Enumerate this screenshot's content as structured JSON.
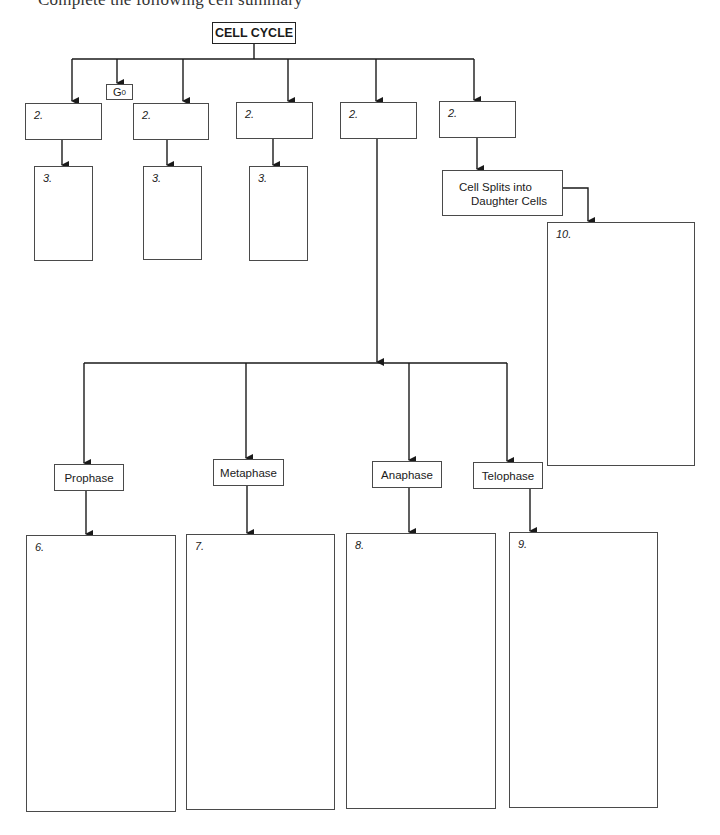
{
  "instruction_partial": "Complete the following cell summary",
  "root": {
    "label": "CELL CYCLE"
  },
  "g0": {
    "label": "G",
    "sub": "0"
  },
  "stage_boxes": [
    {
      "number": "2."
    },
    {
      "number": "2."
    },
    {
      "number": "2."
    },
    {
      "number": "2."
    },
    {
      "number": "2."
    }
  ],
  "detail_boxes": [
    {
      "number": "3."
    },
    {
      "number": "3."
    },
    {
      "number": "3."
    }
  ],
  "cytokinesis": {
    "line1": "Cell Splits into",
    "line2": "Daughter Cells",
    "answer_number": "10."
  },
  "phases": [
    {
      "label": "Prophase",
      "answer_number": "6."
    },
    {
      "label": "Metaphase",
      "answer_number": "7."
    },
    {
      "label": "Anaphase",
      "answer_number": "8."
    },
    {
      "label": "Telophase",
      "answer_number": "9."
    }
  ]
}
